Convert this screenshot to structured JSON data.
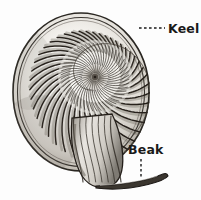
{
  "figure": {
    "style": "pen-and-ink engraving, grayscale",
    "background_color": "#fdfdfd",
    "ink_color": "#1a1a1a",
    "shell_fill": "#f2f0ec",
    "shadow_color": "#5a564f"
  },
  "labels": [
    {
      "id": "keel",
      "text": "Keel",
      "text_x": 168,
      "text_y": 33,
      "leader": {
        "type": "dashed-horizontal",
        "x1": 139,
        "y1": 28,
        "x2": 165,
        "y2": 28
      }
    },
    {
      "id": "beak",
      "text": "Beak",
      "text_x": 128,
      "text_y": 154,
      "leader": {
        "type": "dashed-vertical",
        "x1": 141,
        "y1": 159,
        "x2": 141,
        "y2": 178
      }
    }
  ],
  "shell": {
    "spiral_center_x": 95,
    "spiral_center_y": 77,
    "outer_left_x": 13,
    "outer_right_x": 149,
    "outer_top_y": 8,
    "outer_bottom_y": 186,
    "rib_count": 44,
    "inner_rib_count": 52,
    "beak_tip_x": 168,
    "beak_tip_y": 176
  }
}
